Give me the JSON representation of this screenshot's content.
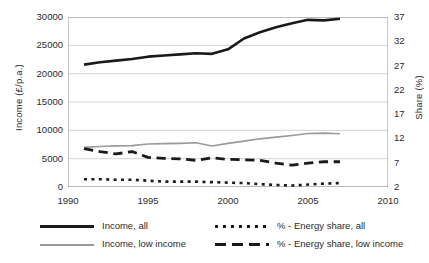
{
  "chart_data": {
    "type": "line",
    "title": "",
    "xlabel": "",
    "ylabel": "Income (£/p.a.)",
    "y2label": "Share (%)",
    "xlim": [
      1990,
      2010
    ],
    "ylim": [
      0,
      30000
    ],
    "y2lim": [
      2,
      37
    ],
    "grid": true,
    "legend_position": "bottom",
    "xticks": [
      "1990",
      "1995",
      "2000",
      "2005",
      "2010"
    ],
    "yticks": [
      "0",
      "5000",
      "10000",
      "15000",
      "20000",
      "25000",
      "30000"
    ],
    "y2ticks": [
      "2",
      "7",
      "12",
      "17",
      "22",
      "27",
      "32",
      "37"
    ],
    "x": [
      1991,
      1992,
      1993,
      1994,
      1995,
      1996,
      1997,
      1998,
      1999,
      2000,
      2001,
      2002,
      2003,
      2004,
      2005,
      2006,
      2007
    ],
    "series": [
      {
        "name": "Income, all",
        "axis": "left",
        "style": "solid",
        "color": "#1a1a1a",
        "width": 2.6,
        "values": [
          21600,
          22000,
          22300,
          22600,
          23000,
          23200,
          23400,
          23600,
          23500,
          24300,
          26200,
          27300,
          28200,
          28900,
          29500,
          29400,
          29700
        ]
      },
      {
        "name": "Income, low income",
        "axis": "left",
        "style": "solid",
        "color": "#9a9a9a",
        "width": 1.6,
        "values": [
          7000,
          7150,
          7250,
          7300,
          7600,
          7650,
          7700,
          7800,
          7250,
          7700,
          8100,
          8500,
          8800,
          9100,
          9450,
          9500,
          9400
        ]
      },
      {
        "name": "% - Energy share, all",
        "axis": "right",
        "style": "dotted",
        "color": "#1a1a1a",
        "width": 2.6,
        "values": [
          3.6,
          3.6,
          3.5,
          3.5,
          3.3,
          3.1,
          3.1,
          3.1,
          3.0,
          2.9,
          2.8,
          2.6,
          2.4,
          2.3,
          2.5,
          2.7,
          2.8
        ]
      },
      {
        "name": "% - Energy share, low income",
        "axis": "right",
        "style": "dashed",
        "color": "#1a1a1a",
        "width": 2.8,
        "values": [
          9.9,
          9.3,
          8.8,
          9.3,
          8.1,
          7.9,
          7.8,
          7.5,
          8.0,
          7.7,
          7.6,
          7.5,
          6.9,
          6.5,
          6.9,
          7.2,
          7.2
        ]
      }
    ]
  },
  "legend": {
    "items": [
      {
        "label": "Income, all",
        "style": "solid",
        "color": "#1a1a1a"
      },
      {
        "label": "Income, low income",
        "style": "solid",
        "color": "#9a9a9a"
      },
      {
        "label": "% - Energy share, all",
        "style": "dotted",
        "color": "#1a1a1a"
      },
      {
        "label": "% - Energy share, low income",
        "style": "dashed",
        "color": "#1a1a1a"
      }
    ]
  }
}
